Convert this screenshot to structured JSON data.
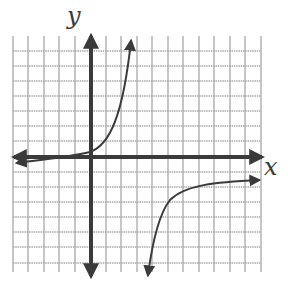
{
  "graph": {
    "x_axis_label": "x",
    "y_axis_label": "y",
    "grid": {
      "x_lines": [
        13,
        28,
        44,
        59,
        75,
        106,
        121,
        137,
        152,
        168,
        183,
        199,
        214,
        230,
        245,
        261
      ],
      "y_lines": [
        51,
        66,
        81,
        96,
        111,
        126,
        141,
        172,
        187,
        202,
        217,
        232,
        247,
        263
      ],
      "left": 13,
      "right": 261,
      "top": 36,
      "bottom": 272,
      "color": "#a8a8a8"
    },
    "axes": {
      "origin": [
        91,
        157
      ],
      "color": "#3a3a3a"
    },
    "colors": {
      "curve": "#3a3a3a",
      "background": "#ffffff"
    }
  },
  "chart_data": {
    "type": "line",
    "title": "",
    "xlabel": "x",
    "ylabel": "y",
    "grid": true,
    "series": [
      {
        "name": "left-branch",
        "points": [
          [
            -5,
            -0.4
          ],
          [
            -3,
            -0.3
          ],
          [
            -1,
            -0.1
          ],
          [
            0,
            0.3
          ],
          [
            1,
            1
          ],
          [
            2,
            3
          ],
          [
            2.5,
            6
          ],
          [
            2.6,
            8
          ]
        ]
      },
      {
        "name": "right-branch",
        "points": [
          [
            3.7,
            -8
          ],
          [
            4.2,
            -5
          ],
          [
            5,
            -3
          ],
          [
            6,
            -2.3
          ],
          [
            8,
            -1.9
          ],
          [
            11,
            -1.5
          ]
        ]
      }
    ]
  }
}
